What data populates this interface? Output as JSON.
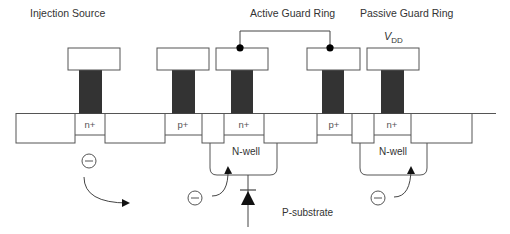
{
  "diagram": {
    "titles": {
      "injection_source": "Injection Source",
      "active_guard_ring": "Active Guard Ring",
      "passive_guard_ring": "Passive Guard Ring"
    },
    "supply": {
      "symbol": "V",
      "subscript": "DD"
    },
    "diffusions": [
      {
        "id": "injector-n",
        "label": "n+"
      },
      {
        "id": "ring1-p",
        "label": "p+"
      },
      {
        "id": "active-n",
        "label": "n+"
      },
      {
        "id": "active-p",
        "label": "p+"
      },
      {
        "id": "passive-n",
        "label": "n+"
      }
    ],
    "wells": [
      {
        "id": "nwell-active",
        "label": "N-well"
      },
      {
        "id": "nwell-passive",
        "label": "N-well"
      }
    ],
    "substrate_label": "P-substrate",
    "electron_symbol": "−",
    "colors": {
      "line": "#555555",
      "plug": "#333333",
      "fill": "#ffffff",
      "dot": "#000000"
    }
  }
}
